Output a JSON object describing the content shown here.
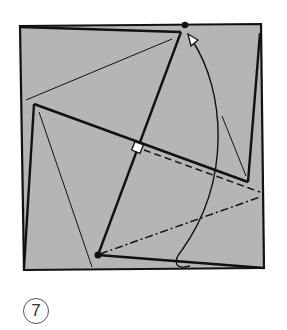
{
  "diagram": {
    "type": "origami-folding-step",
    "paper_color": "#b5b5b5",
    "line_color": "#111111",
    "step_number": "7",
    "elements": [
      {
        "name": "paper-square",
        "kind": "filled-quad"
      },
      {
        "name": "pinwheel-flap-edges",
        "kind": "solid-lines"
      },
      {
        "name": "crease-lines",
        "kind": "thin-lines"
      },
      {
        "name": "valley-fold-line",
        "kind": "dashed-line"
      },
      {
        "name": "mountain-fold-line",
        "kind": "dash-dot-line"
      },
      {
        "name": "reference-dot-top",
        "kind": "dot"
      },
      {
        "name": "reference-dot-bottom",
        "kind": "dot"
      },
      {
        "name": "fold-arrow",
        "kind": "curved-arrow",
        "direction": "bottom-to-top"
      },
      {
        "name": "center-square",
        "kind": "small-white-square"
      }
    ]
  }
}
